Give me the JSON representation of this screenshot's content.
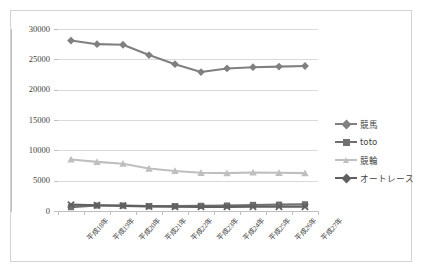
{
  "chart_data": {
    "type": "line",
    "title": "",
    "xlabel": "",
    "ylabel": "",
    "ylim": [
      0,
      30000
    ],
    "ytick_step": 5000,
    "grid": true,
    "legend_position": "right",
    "categories": [
      "平成18年",
      "平成19年",
      "平成20年",
      "平成21年",
      "平成22年",
      "平成23年",
      "平成24年",
      "平成25年",
      "平成26年",
      "平成27年"
    ],
    "yticks": [
      "0",
      "5000",
      "10000",
      "15000",
      "20000",
      "25000",
      "30000"
    ],
    "series": [
      {
        "name": "競馬",
        "color": "#808080",
        "marker": "diamond",
        "values": [
          28100,
          27500,
          27400,
          25700,
          24200,
          22900,
          23500,
          23700,
          23800,
          23900
        ]
      },
      {
        "name": "toto",
        "color": "#707070",
        "marker": "square",
        "values": [
          640,
          900,
          900,
          800,
          800,
          850,
          900,
          1000,
          1050,
          1100
        ]
      },
      {
        "name": "競輪",
        "color": "#bfbfbf",
        "marker": "triangle",
        "values": [
          8500,
          8100,
          7800,
          7000,
          6600,
          6300,
          6250,
          6350,
          6300,
          6250
        ]
      },
      {
        "name": "オートレース",
        "color": "#606060",
        "marker": "cross",
        "values": [
          1050,
          950,
          850,
          750,
          700,
          680,
          680,
          700,
          700,
          700
        ]
      }
    ]
  },
  "legend": {
    "items": [
      {
        "label": "競馬"
      },
      {
        "label": "toto"
      },
      {
        "label": "競輪"
      },
      {
        "label": "オートレース"
      }
    ]
  }
}
